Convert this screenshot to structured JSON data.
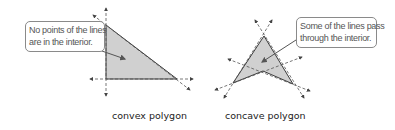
{
  "figures": [
    {
      "id": "convex",
      "caption": "convex polygon",
      "callout": {
        "line1": "No points of the lines",
        "line2": "are in the interior."
      }
    },
    {
      "id": "concave",
      "caption": "concave polygon",
      "callout": {
        "line1": "Some of the lines pass",
        "line2": "through the interior."
      }
    }
  ],
  "colors": {
    "fill": "#d0d0d0",
    "stroke": "#3a3a3a",
    "dashed": "#555555",
    "callout_border": "#8a8a8a"
  }
}
